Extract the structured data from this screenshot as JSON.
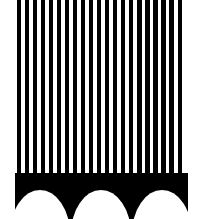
{
  "figure": {
    "canvas": {
      "width": 203,
      "height": 219
    },
    "background_color": "#ffffff",
    "ink_color": "#000000",
    "border_color": "#3a3a3a"
  },
  "frame": {
    "name": "outer-frame",
    "left": 15,
    "top": 0,
    "width": 173,
    "height": 219,
    "border_width": 1,
    "border_color": "#3a3a3a",
    "has_bottom_border": false
  },
  "stripes_panel": {
    "name": "vertical-stripe-field",
    "top": 0,
    "height": 173,
    "stripe_count": 21,
    "stripe_color": "#000000",
    "gap_color": "#ffffff",
    "stripe_width": 4.3,
    "pitch": 8.05,
    "first_stripe_left": 1.5,
    "orientation": "vertical"
  },
  "arch_band": {
    "name": "arch-band",
    "top": 173,
    "height": 46,
    "fill_color": "#000000",
    "arch_count": 3,
    "arch_fill": "#ffffff",
    "arch_shape": "semicircle",
    "arch_width": 60,
    "arch_height": 44,
    "arch_baseline_offset": 17,
    "arches": [
      {
        "label": "arch-1",
        "left": -5,
        "top": 17
      },
      {
        "label": "arch-2",
        "left": 56,
        "top": 17
      },
      {
        "label": "arch-3",
        "left": 117,
        "top": 17
      }
    ]
  }
}
